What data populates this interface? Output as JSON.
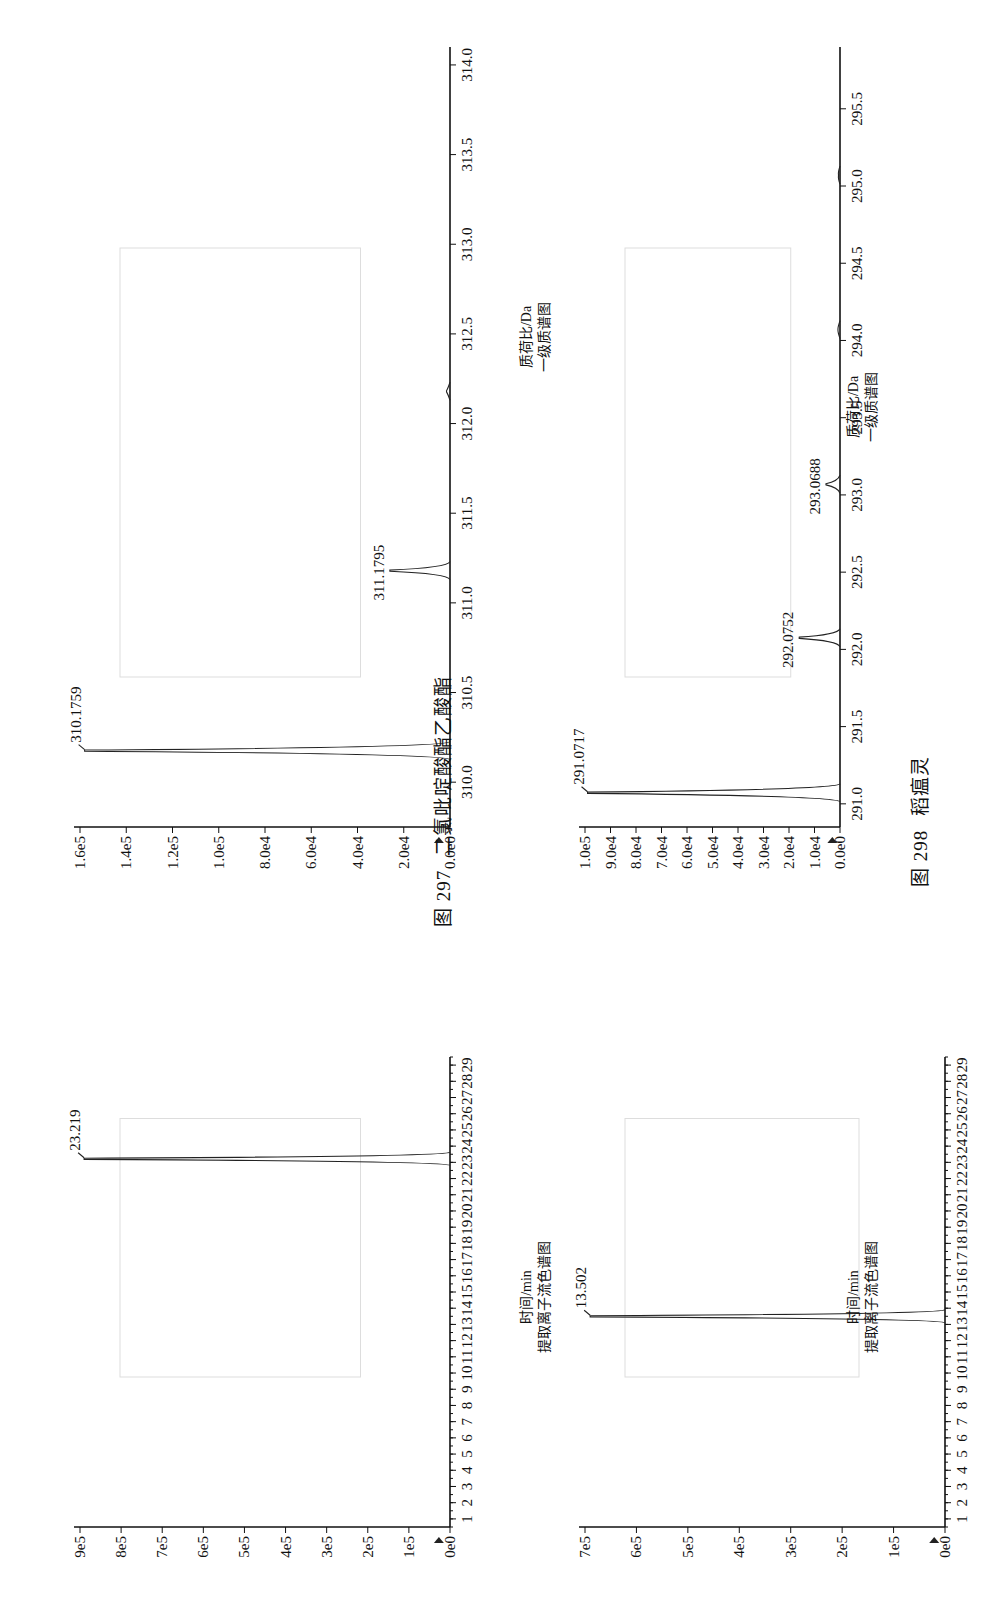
{
  "figures": [
    {
      "number": "图 297",
      "title": "二氯吡啶酸酯乙酸酯",
      "chromatogram": {
        "xlabel": "时间/min",
        "subtitle": "提取离子流色谱图",
        "peak_label": "23.219",
        "yticks": [
          "9e5",
          "8e5",
          "7e5",
          "6e5",
          "5e5",
          "4e5",
          "3e5",
          "2e5",
          "1e5",
          "0e0"
        ],
        "xticks": [
          "1",
          "2",
          "3",
          "4",
          "5",
          "6",
          "7",
          "8",
          "9",
          "10",
          "11",
          "12",
          "13",
          "14",
          "15",
          "16",
          "17",
          "18",
          "19",
          "20",
          "21",
          "22",
          "23",
          "24",
          "25",
          "26",
          "27",
          "28",
          "29"
        ]
      },
      "spectrum": {
        "xlabel": "质荷比/Da",
        "subtitle": "一级质谱图",
        "peak_labels": [
          "310.1759",
          "311.1795"
        ],
        "yticks": [
          "1.6e5",
          "1.4e5",
          "1.2e5",
          "1.0e5",
          "8.0e4",
          "6.0e4",
          "4.0e4",
          "2.0e4",
          "0.0e0"
        ],
        "xticks": [
          "310.0",
          "310.5",
          "311.0",
          "311.5",
          "312.0",
          "312.5",
          "313.0",
          "313.5",
          "314.0"
        ]
      }
    },
    {
      "number": "图 298",
      "title": "稻瘟灵",
      "chromatogram": {
        "xlabel": "时间/min",
        "subtitle": "提取离子流色谱图",
        "peak_label": "13.502",
        "yticks": [
          "7e5",
          "6e5",
          "5e5",
          "4e5",
          "3e5",
          "2e5",
          "1e5",
          "0e0"
        ],
        "xticks": [
          "1",
          "2",
          "3",
          "4",
          "5",
          "6",
          "7",
          "8",
          "9",
          "10",
          "11",
          "12",
          "13",
          "14",
          "15",
          "16",
          "17",
          "18",
          "19",
          "20",
          "21",
          "22",
          "23",
          "24",
          "25",
          "26",
          "27",
          "28",
          "29"
        ]
      },
      "spectrum": {
        "xlabel": "质荷比/Da",
        "subtitle": "一级质谱图",
        "peak_labels": [
          "291.0717",
          "292.0752",
          "293.0688"
        ],
        "yticks": [
          "1.0e5",
          "9.0e4",
          "8.0e4",
          "7.0e4",
          "6.0e4",
          "5.0e4",
          "4.0e4",
          "3.0e4",
          "2.0e4",
          "1.0e4",
          "0.0e0"
        ],
        "xticks": [
          "291.0",
          "291.5",
          "292.0",
          "292.5",
          "293.0",
          "293.5",
          "294.0",
          "294.5",
          "295.0",
          "295.5"
        ]
      }
    }
  ],
  "chart_data": [
    {
      "type": "line",
      "title": "图 297 二氯吡啶酸酯乙酸酯 — 提取离子流色谱图",
      "xlabel": "时间/min",
      "ylabel": "",
      "xlim": [
        0.5,
        29.5
      ],
      "ylim": [
        0,
        900000
      ],
      "peaks": [
        {
          "x": 23.219,
          "y": 890000,
          "label": "23.219"
        }
      ],
      "grid": false
    },
    {
      "type": "bar",
      "title": "图 297 二氯吡啶酸酯乙酸酯 — 一级质谱图",
      "xlabel": "质荷比/Da",
      "ylabel": "",
      "xlim": [
        309.75,
        314.1
      ],
      "ylim": [
        0,
        160000
      ],
      "x": [
        310.1759,
        311.1795,
        312.18
      ],
      "values": [
        158000,
        26000,
        1500
      ],
      "labels": [
        "310.1759",
        "311.1795",
        ""
      ],
      "grid": false
    },
    {
      "type": "line",
      "title": "图 298 稻瘟灵 — 提取离子流色谱图",
      "xlabel": "时间/min",
      "ylabel": "",
      "xlim": [
        0.5,
        29.5
      ],
      "ylim": [
        0,
        700000
      ],
      "peaks": [
        {
          "x": 13.502,
          "y": 690000,
          "label": "13.502"
        }
      ],
      "grid": false
    },
    {
      "type": "bar",
      "title": "图 298 稻瘟灵 — 一级质谱图",
      "xlabel": "质荷比/Da",
      "ylabel": "",
      "xlim": [
        290.85,
        295.9
      ],
      "ylim": [
        0,
        100000
      ],
      "x": [
        291.0717,
        292.0752,
        293.0688,
        294.07,
        295.07
      ],
      "values": [
        99000,
        16000,
        5500,
        800,
        600
      ],
      "labels": [
        "291.0717",
        "292.0752",
        "293.0688",
        "",
        ""
      ],
      "grid": false
    }
  ]
}
